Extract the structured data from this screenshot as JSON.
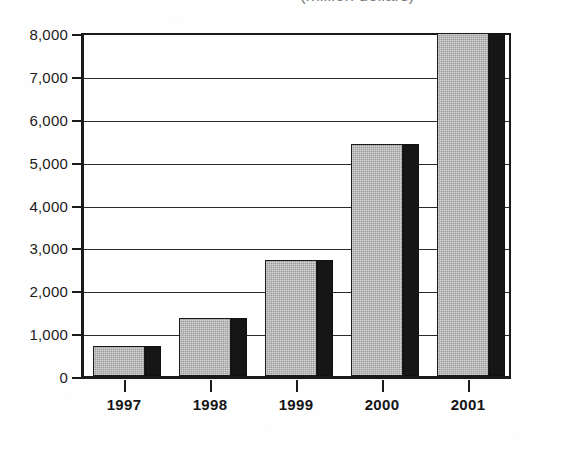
{
  "subtitle": "(million dollars)",
  "chart_data": {
    "type": "bar",
    "title": "",
    "subtitle": "(million dollars)",
    "xlabel": "",
    "ylabel": "",
    "categories": [
      "1997",
      "1998",
      "1999",
      "2000",
      "2001"
    ],
    "values": [
      700,
      1350,
      2700,
      5400,
      8100
    ],
    "series": [
      {
        "name": "",
        "values": [
          700,
          1350,
          2700,
          5400,
          8100
        ]
      }
    ],
    "ylim": [
      0,
      8000
    ],
    "ytick_values": [
      0,
      1000,
      2000,
      3000,
      4000,
      5000,
      6000,
      7000,
      8000
    ],
    "ytick_labels": [
      "0",
      "1,000",
      "2,000",
      "3,000",
      "4,000",
      "5,000",
      "6,000",
      "7,000",
      "8,000"
    ],
    "grid": true,
    "grid_axis": "y",
    "legend": false,
    "legend_position": "none",
    "bar_style": "3d-shadow",
    "colors": {
      "bar_face": "#9c9c9c",
      "bar_shadow": "#161616",
      "axis": "#1a1a1a",
      "gridline": "#2a2a2a",
      "text": "#141414",
      "background": "#ffffff"
    }
  }
}
